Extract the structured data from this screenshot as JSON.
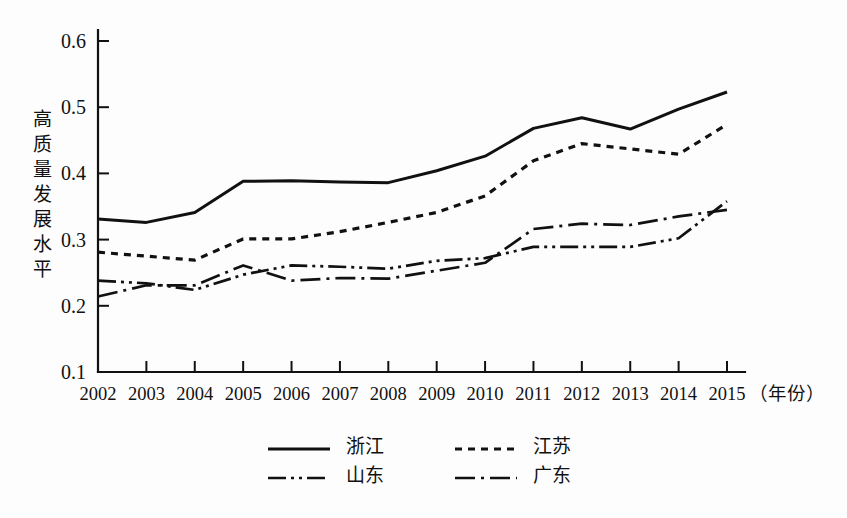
{
  "chart_data": {
    "type": "line",
    "title": "",
    "xlabel": "年份",
    "xlabel_display": "（年份）",
    "ylabel": "高质量发展水平",
    "ylabel_chars": [
      "高",
      "质",
      "量",
      "发",
      "展",
      "水",
      "平"
    ],
    "categories": [
      "2002",
      "2003",
      "2004",
      "2005",
      "2006",
      "2007",
      "2008",
      "2009",
      "2010",
      "2011",
      "2012",
      "2013",
      "2014",
      "2015"
    ],
    "x": [
      2002,
      2003,
      2004,
      2005,
      2006,
      2007,
      2008,
      2009,
      2010,
      2011,
      2012,
      2013,
      2014,
      2015
    ],
    "xlim": [
      2002,
      2015
    ],
    "ylim": [
      0.1,
      0.62
    ],
    "ytick_values": [
      0.1,
      0.2,
      0.3,
      0.4,
      0.5,
      0.6
    ],
    "ytick_labels": [
      "0.1",
      "0.2",
      "0.3",
      "0.4",
      "0.5",
      "0.6"
    ],
    "grid": false,
    "legend_position": "bottom",
    "line_color": "#111111",
    "series": [
      {
        "name": "浙江",
        "style": "solid",
        "dash": "none",
        "width": 3.0,
        "values": [
          0.331,
          0.326,
          0.341,
          0.388,
          0.389,
          0.387,
          0.386,
          0.404,
          0.426,
          0.468,
          0.484,
          0.467,
          0.497,
          0.523
        ]
      },
      {
        "name": "江苏",
        "style": "dotted",
        "dash": "7,6",
        "width": 3.2,
        "values": [
          0.281,
          0.275,
          0.269,
          0.301,
          0.301,
          0.312,
          0.326,
          0.341,
          0.366,
          0.419,
          0.445,
          0.437,
          0.429,
          0.474
        ]
      },
      {
        "name": "山东",
        "style": "dash-dot-dot",
        "dash": "18,5,3,5,3,5",
        "width": 2.7,
        "values": [
          0.238,
          0.234,
          0.224,
          0.247,
          0.261,
          0.259,
          0.256,
          0.268,
          0.272,
          0.289,
          0.289,
          0.289,
          0.302,
          0.358
        ]
      },
      {
        "name": "广东",
        "style": "dash-dot",
        "dash": "20,6,3,6",
        "width": 2.7,
        "values": [
          0.214,
          0.231,
          0.231,
          0.261,
          0.238,
          0.242,
          0.241,
          0.253,
          0.265,
          0.316,
          0.324,
          0.322,
          0.335,
          0.345
        ]
      }
    ]
  },
  "legend": {
    "entries": [
      {
        "label": "浙江",
        "dash": "none",
        "width": 3.0
      },
      {
        "label": "江苏",
        "dash": "7,6",
        "width": 3.2
      },
      {
        "label": "山东",
        "dash": "18,5,3,5,3,5",
        "width": 2.7
      },
      {
        "label": "广东",
        "dash": "20,6,3,6",
        "width": 2.7
      }
    ]
  }
}
